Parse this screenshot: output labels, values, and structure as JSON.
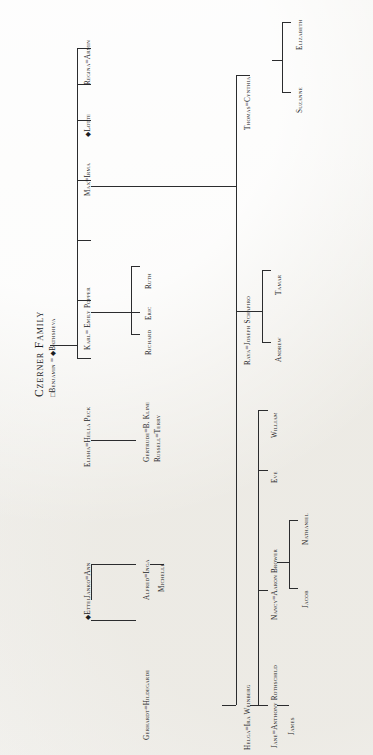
{
  "document": {
    "title": "Czerner Family",
    "orientation": "rotated-90-ccw",
    "paper_color": "#f2f1ee",
    "ink_color": "#1b1c1e"
  },
  "legend": {
    "square_symbol": "□",
    "diamond_symbol": "◆",
    "marriage_symbol": "="
  },
  "tree": {
    "root": {
      "id": "root",
      "label": "□Benjamin = ◆Bathsheva",
      "husband": "Benjamin",
      "wife": "Bathsheva",
      "husband_symbol": "□",
      "wife_symbol": "◆"
    },
    "generation2": [
      {
        "id": "g2-ettel",
        "label": "◆Ettel"
      },
      {
        "id": "g2-janko",
        "label": "Janko=Ann"
      },
      {
        "id": "g2-elisha",
        "label": "Elisha=Hella Peck"
      },
      {
        "id": "g2-karl",
        "label": "Karl= Emily Popper"
      },
      {
        "id": "g2-max",
        "label": "Max=Irma"
      },
      {
        "id": "g2-lotte",
        "label": "◆Lotte"
      },
      {
        "id": "g2-regina",
        "label": "Regina=Armin"
      }
    ],
    "generation3": [
      {
        "id": "g3-gerhardt",
        "label": "Gerhardt=Hildegarde",
        "parent": "g2-ettel"
      },
      {
        "id": "g3-alfred",
        "label": "Alfred=Inga",
        "parent": "g2-janko"
      },
      {
        "id": "g3-gertrude",
        "label": "Gertrude=B. Kline",
        "parent": "g2-elisha"
      },
      {
        "id": "g3-richard",
        "label": "Richard",
        "parent": "g2-karl"
      },
      {
        "id": "g3-eric",
        "label": "Eric",
        "parent": "g2-karl"
      },
      {
        "id": "g3-ruth",
        "label": "Ruth",
        "parent": "g2-karl"
      },
      {
        "id": "g3-helga",
        "label": "Helga=Ira Weinberg",
        "parent": "g2-max"
      },
      {
        "id": "g3-raya",
        "label": "Raya=Joseph Schapiro",
        "parent": "g2-max"
      },
      {
        "id": "g3-thomas",
        "label": "Thomas=Cynthia",
        "parent": "g2-max"
      }
    ],
    "generation4": [
      {
        "id": "g4-michelle",
        "label": "Michelle",
        "parent": "g3-alfred"
      },
      {
        "id": "g4-russell",
        "label": "Russell=Terry",
        "parent": "g3-gertrude"
      },
      {
        "id": "g4-jane",
        "label": "Jane=Anthony Rothschild",
        "parent": "g3-helga"
      },
      {
        "id": "g4-nancy",
        "label": "Nancy=Aaron Brower",
        "parent": "g3-helga"
      },
      {
        "id": "g4-eve",
        "label": "Eve",
        "parent": "g3-helga"
      },
      {
        "id": "g4-william",
        "label": "William",
        "parent": "g3-helga"
      },
      {
        "id": "g4-andrew",
        "label": "Andrew",
        "parent": "g3-raya"
      },
      {
        "id": "g4-tamar",
        "label": "Tamar",
        "parent": "g3-raya"
      },
      {
        "id": "g4-suzanne",
        "label": "Suzanne",
        "parent": "g3-thomas"
      },
      {
        "id": "g4-elizabeth",
        "label": "Elizabeth",
        "parent": "g3-thomas"
      }
    ],
    "generation5": [
      {
        "id": "g5-james",
        "label": "James",
        "parent": "g4-jane"
      },
      {
        "id": "g5-jacob",
        "label": "Jacob",
        "parent": "g4-nancy"
      },
      {
        "id": "g5-nathaniel",
        "label": "Nathaniel",
        "parent": "g4-nancy"
      }
    ]
  }
}
